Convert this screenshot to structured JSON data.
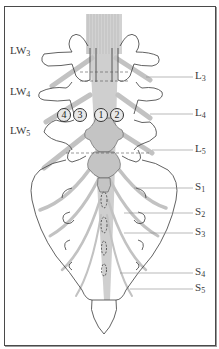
{
  "figure": {
    "left_labels": [
      {
        "base": "LW",
        "sub": "3",
        "x": 10,
        "y": 51
      },
      {
        "base": "LW",
        "sub": "4",
        "x": 10,
        "y": 92
      },
      {
        "base": "LW",
        "sub": "5",
        "x": 10,
        "y": 131
      }
    ],
    "right_labels": [
      {
        "base": "L",
        "sub": "3",
        "x": 196,
        "y": 73
      },
      {
        "base": "L",
        "sub": "4",
        "x": 196,
        "y": 112
      },
      {
        "base": "L",
        "sub": "5",
        "x": 196,
        "y": 149
      },
      {
        "base": "S",
        "sub": "1",
        "x": 196,
        "y": 184
      },
      {
        "base": "S",
        "sub": "2",
        "x": 196,
        "y": 210
      },
      {
        "base": "S",
        "sub": "3",
        "x": 196,
        "y": 232
      },
      {
        "base": "S",
        "sub": "4",
        "x": 196,
        "y": 272
      },
      {
        "base": "S",
        "sub": "5",
        "x": 196,
        "y": 287
      }
    ],
    "numbered_markers": [
      {
        "label": "4",
        "x": 57,
        "y": 108
      },
      {
        "label": "3",
        "x": 73,
        "y": 108
      },
      {
        "label": "1",
        "x": 94,
        "y": 108
      },
      {
        "label": "2",
        "x": 110,
        "y": 108
      }
    ],
    "colors": {
      "outline": "#3a3a3a",
      "nerve": "#bdbdbd",
      "cauda": "#c8c8c8",
      "dura_fill": "#bfbfbf",
      "leader": "#8a8a8a",
      "dashed": "#555555"
    }
  }
}
